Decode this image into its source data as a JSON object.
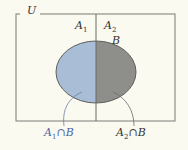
{
  "universe_label": "U",
  "regions": {
    "a1": {
      "label": "A",
      "sub": "1"
    },
    "a2": {
      "label": "A",
      "sub": "2"
    },
    "b": {
      "label": "B"
    }
  },
  "annotations": [
    {
      "label": "A",
      "sub": "1",
      "op": "∩B",
      "color": "#4a64a8"
    },
    {
      "label": "A",
      "sub": "2",
      "op": "∩B",
      "color": "#333333"
    }
  ],
  "colors": {
    "left_fill": "#a9bdd6",
    "right_fill": "#8e8e8a",
    "stroke": "#6b6b68",
    "background": "#fbfaf1"
  }
}
